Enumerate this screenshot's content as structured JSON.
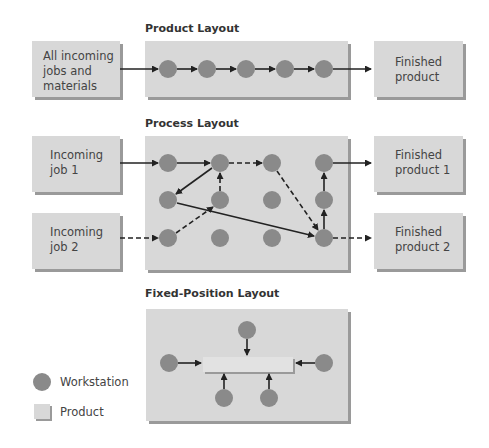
{
  "product_layout": {
    "title": "Product Layout",
    "input_label_lines": [
      "All incoming",
      "jobs and",
      "materials"
    ],
    "output_label_lines": [
      "Finished",
      "product"
    ]
  },
  "process_layout": {
    "title": "Process Layout",
    "input1_lines": [
      "Incoming",
      "job 1"
    ],
    "input2_lines": [
      "Incoming",
      "job 2"
    ],
    "output1_lines": [
      "Finished",
      "product 1"
    ],
    "output2_lines": [
      "Finished",
      "product 2"
    ]
  },
  "fixed_layout": {
    "title": "Fixed-Position Layout"
  },
  "legend": {
    "workstation": "Workstation",
    "product": "Product"
  },
  "colors": {
    "box": "#d8d8d8",
    "box_shadow": "#9a9a9a",
    "workstation": "#8a8a8a",
    "arrow": "#222222"
  }
}
